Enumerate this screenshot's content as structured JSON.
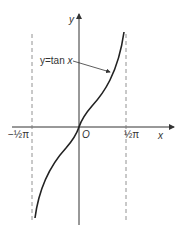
{
  "diagram": {
    "curve_label": "y=tan x",
    "curve_label_y": "y=tan ",
    "curve_label_x": "x",
    "x_axis_label": "x",
    "y_axis_label": "y",
    "origin_label": "O",
    "left_asymptote_label": "−½π",
    "right_asymptote_label": "½π",
    "function": "tan x",
    "asymptotes": [
      "-π/2",
      "π/2"
    ],
    "colors": {
      "curve": "#222222",
      "axes": "#333333",
      "asymptote": "#666666"
    }
  }
}
